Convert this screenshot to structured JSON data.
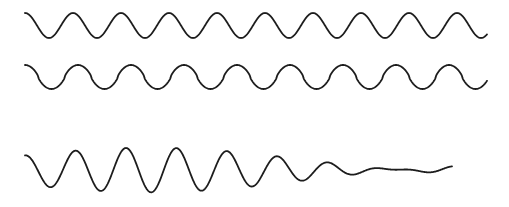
{
  "figure": {
    "width": 509,
    "height": 207,
    "background_color": "#ffffff",
    "stroke_color": "#1d1d1d",
    "stroke_width": 1.8
  },
  "chart_data": {
    "type": "line",
    "xlabel": "",
    "ylabel": "",
    "grid": false,
    "legend": "none",
    "axes_visible": false,
    "tick_labels_x": [],
    "tick_labels_y": [],
    "xlim": [
      0,
      509
    ],
    "ylim": [
      207,
      0
    ],
    "series": [
      {
        "name": "wave-1-sine",
        "description": "Smooth sinusoid, higher frequency of the pair",
        "waveform": "sine",
        "x_start": 25,
        "x_end": 487,
        "baseline_y": 25.5,
        "amplitude": 12.5,
        "period_px": 48.0,
        "cycles": 9.6,
        "phase_deg": 90,
        "shape_exponent": 1.0
      },
      {
        "name": "wave-2-sine",
        "description": "Sinusoid with longer period and sharper, more triangular peaks",
        "waveform": "sine",
        "x_start": 25,
        "x_end": 487,
        "baseline_y": 77.0,
        "amplitude": 12.0,
        "period_px": 53.0,
        "cycles": 8.72,
        "phase_deg": 90,
        "shape_exponent": 0.72
      },
      {
        "name": "wave-3-beat-sum",
        "description": "Sum of wave 1 and wave 2 showing a beat envelope with a node near the centre",
        "waveform": "beat-sum",
        "x_start": 25,
        "x_end": 452,
        "baseline_y": 170.0,
        "amplitude": 12.8,
        "period_px_a": 48.0,
        "period_px_b": 53.0,
        "phase_deg": 90,
        "beat_node_x": 190,
        "envelope_min": 0.06,
        "envelope_max": 1.0
      }
    ]
  }
}
